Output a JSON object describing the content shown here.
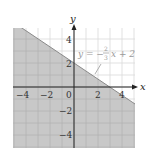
{
  "chart_data": {
    "type": "inequality-region",
    "title": "",
    "xlabel": "x",
    "ylabel": "y",
    "xlim": [
      -5.1,
      5.1
    ],
    "ylim": [
      -5.1,
      4.9
    ],
    "grid": true,
    "grid_step": 1,
    "x_ticks": [
      -4,
      -2,
      0,
      2,
      4
    ],
    "y_ticks": [
      4,
      2,
      -2,
      -4
    ],
    "x_tick_labels": [
      "−4",
      "−2",
      "0",
      "2",
      "4"
    ],
    "y_tick_labels": [
      "4",
      "2",
      "−2",
      "−4"
    ],
    "boundary": {
      "equation": "y = -(2/3)x + 2",
      "slope": -0.6667,
      "intercept": 2,
      "style": "solid"
    },
    "shaded_region": "below",
    "annotation": {
      "text_prefix": "y = −",
      "fraction_num": "2",
      "fraction_den": "3",
      "text_suffix": "x + 2"
    },
    "colors": {
      "shade": "#c8c8c8",
      "grid_unshaded": "#d9d9d9",
      "grid_shaded": "#b2b2b2",
      "axis": "#222222",
      "annotation": "#9a9a9a"
    }
  }
}
